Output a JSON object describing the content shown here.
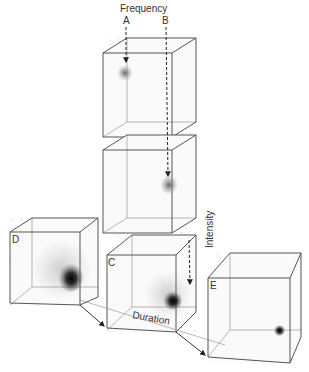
{
  "labels": {
    "frequency": "Frequency",
    "a": "A",
    "b": "B",
    "intensity": "Intensity",
    "duration": "Duration"
  },
  "cubes": [
    {
      "id": "top",
      "label": ""
    },
    {
      "id": "middle",
      "label": ""
    },
    {
      "id": "c",
      "label": "C"
    },
    {
      "id": "d",
      "label": "D"
    },
    {
      "id": "e",
      "label": "E"
    }
  ]
}
